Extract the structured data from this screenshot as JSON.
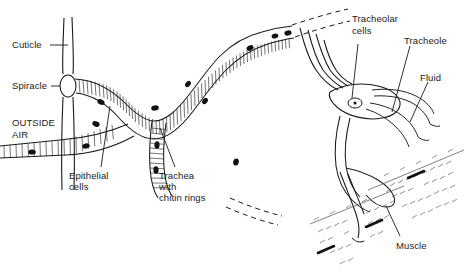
{
  "diagram": {
    "background_color": "#ffffff",
    "stroke_color": "#1a1a1a",
    "nucleus_color": "#111111",
    "labels": {
      "cuticle": "Cuticle",
      "spiracle": "Spiracle",
      "outside_air_line1": "OUTSIDE",
      "outside_air_line2": "AIR",
      "epithelial_line1": "Epithelial",
      "epithelial_line2": "cells",
      "trachea_line1": "Trachea",
      "trachea_line2": "with",
      "trachea_line3": "chitin rings",
      "tracheolar_line1": "Tracheolar",
      "tracheolar_line2": "cells",
      "tracheole": "Tracheole",
      "fluid": "Fluid",
      "muscle": "Muscle"
    }
  }
}
